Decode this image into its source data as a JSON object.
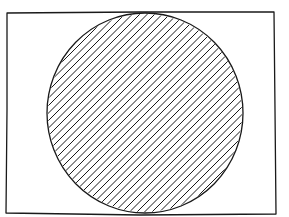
{
  "figure": {
    "stroke_color": "#1a1a1a",
    "background_color": "#ffffff",
    "rectangle": {
      "x": 7,
      "y": 12,
      "width": 268,
      "height": 202
    },
    "circle": {
      "cx": 145,
      "cy": 113,
      "rx": 98,
      "ry": 100
    },
    "hatch": {
      "angle_deg": 45,
      "spacing": 7.5,
      "direction": "bottom-left to top-right"
    }
  }
}
